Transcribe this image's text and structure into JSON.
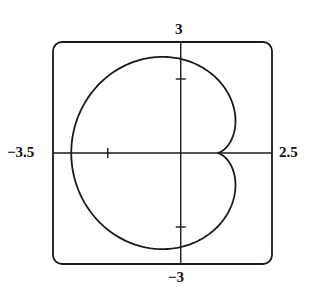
{
  "chart_data": {
    "type": "line",
    "title": "",
    "xlabel": "",
    "ylabel": "",
    "xlim": [
      -3.5,
      2.5
    ],
    "ylim": [
      -3,
      3
    ],
    "grid": false,
    "legend": null,
    "window_labels": {
      "xmin": "−3.5",
      "xmax": "2.5",
      "ymax": "3",
      "ymin": "−3"
    },
    "axis_ticks": {
      "x": [
        -2
      ],
      "y": [
        2,
        -2
      ]
    },
    "curve": {
      "param": "theta from 0 to 2pi",
      "x_expr": "1 + 2(1 - cos t) cos t",
      "y_expr": "2(1 - cos t) sin t",
      "key_points": [
        {
          "name": "cusp",
          "x": 1.0,
          "y": 0
        },
        {
          "name": "leftmost",
          "x": -3.0,
          "y": 0
        },
        {
          "name": "top_y_axis_crossing",
          "x": 0,
          "y": 2.5
        },
        {
          "name": "bottom_y_axis_crossing",
          "x": 0,
          "y": -2.5
        },
        {
          "name": "upper_right_bulge",
          "x": 1.5,
          "y": 1.3
        },
        {
          "name": "lower_right_bulge",
          "x": 1.5,
          "y": -1.3
        }
      ]
    },
    "colors": {
      "curve": "#1a1a1a",
      "frame": "#1a1a1a",
      "axes": "#1a1a1a",
      "background": "#ffffff"
    }
  }
}
